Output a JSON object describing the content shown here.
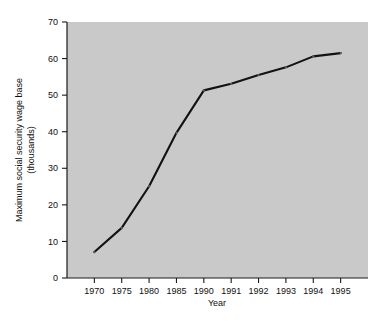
{
  "chart_data": {
    "type": "line",
    "title": "",
    "xlabel": "Year",
    "ylabel": "Maximum social security wage base (thousands)",
    "ylabel_lines": [
      "Maximum social security wage base",
      "(thousands)"
    ],
    "categories": [
      "1970",
      "1975",
      "1980",
      "1985",
      "1990",
      "1991",
      "1992",
      "1993",
      "1994",
      "1995"
    ],
    "values": [
      7.1,
      13.7,
      25.1,
      39.7,
      51.3,
      53.1,
      55.5,
      57.6,
      60.6,
      61.5
    ],
    "series": [
      {
        "name": "Maximum social security wage base",
        "values": [
          7.1,
          13.7,
          25.1,
          39.7,
          51.3,
          53.1,
          55.5,
          57.6,
          60.6,
          61.5
        ]
      }
    ],
    "ylim": [
      0,
      70
    ],
    "yticks": [
      0,
      10,
      20,
      30,
      40,
      50,
      60,
      70
    ],
    "ytick_labels": [
      "0",
      "10",
      "20",
      "30",
      "40",
      "50",
      "60",
      "70"
    ],
    "xtick_labels": [
      "1970",
      "1975",
      "1980",
      "1985",
      "1990",
      "1991",
      "1992",
      "1993",
      "1994",
      "1995"
    ],
    "grid": false,
    "legend": false,
    "legend_position": "none",
    "x_scale": "categorical",
    "colors": {
      "line": "#121212",
      "plot_background": "#c9c9c9",
      "axis": "#1a1a1a",
      "text": "#101010",
      "figure_background": "#ffffff"
    }
  },
  "axis_titles": {
    "x": "Year",
    "y_line1": "Maximum social security wage base",
    "y_line2": "(thousands)"
  }
}
